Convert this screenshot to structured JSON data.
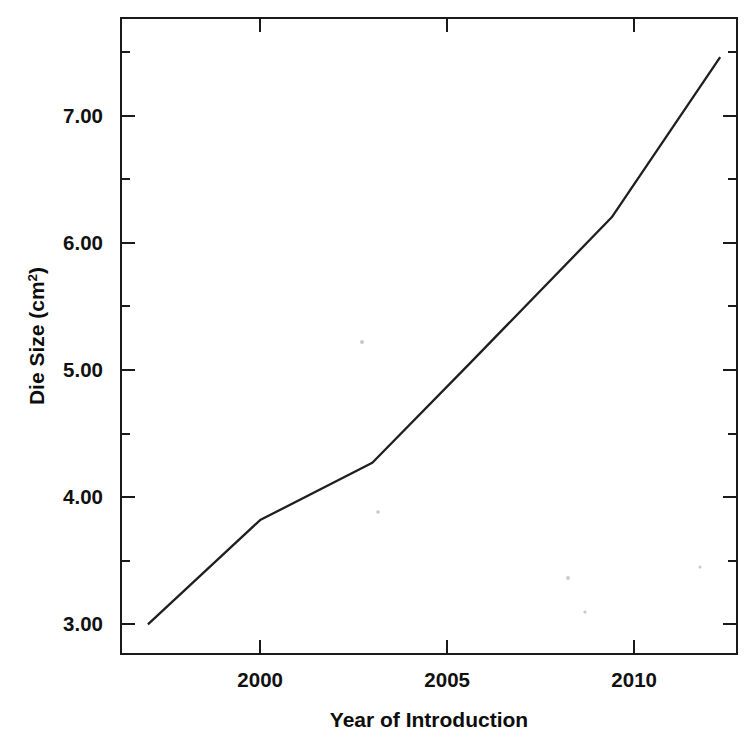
{
  "chart_data": {
    "type": "line",
    "title": "",
    "subtitle": "",
    "xlabel": "Year of Introduction",
    "ylabel": "Die Size (cm2)",
    "ylabel_base": "Die Size (cm",
    "ylabel_sup": "2",
    "ylabel_tail": ")",
    "xlim": [
      1996.28,
      2012.75
    ],
    "ylim": [
      2.767,
      7.767
    ],
    "grid": false,
    "legend": null,
    "legend_position": "none",
    "line_color": "#1f1f1f",
    "axis_color": "#1a1a1a",
    "background_color": "#ffffff",
    "xticks": [
      2000,
      2005,
      2010
    ],
    "xtick_labels": [
      "2000",
      "2005",
      "2010"
    ],
    "xticks_minor": [],
    "yticks": [
      3.0,
      4.0,
      5.0,
      6.0,
      7.0
    ],
    "ytick_labels": [
      "3.00",
      "4.00",
      "5.00",
      "6.00",
      "7.00"
    ],
    "yticks_minor": [
      3.5,
      4.5,
      5.5,
      6.5,
      7.5
    ],
    "series": [
      {
        "name": "Die Size",
        "x": [
          1997.0,
          2000.0,
          2003.0,
          2005.6,
          2009.4,
          2012.3
        ],
        "values": [
          3.0,
          3.82,
          4.27,
          5.05,
          6.2,
          7.46
        ]
      }
    ]
  },
  "annotations": {
    "specks": [
      {
        "x": 362,
        "y": 342,
        "r": 2.0
      },
      {
        "x": 378,
        "y": 512,
        "r": 1.8
      },
      {
        "x": 568,
        "y": 578,
        "r": 1.9
      },
      {
        "x": 585,
        "y": 612,
        "r": 1.6
      },
      {
        "x": 700,
        "y": 567,
        "r": 1.5
      }
    ]
  }
}
